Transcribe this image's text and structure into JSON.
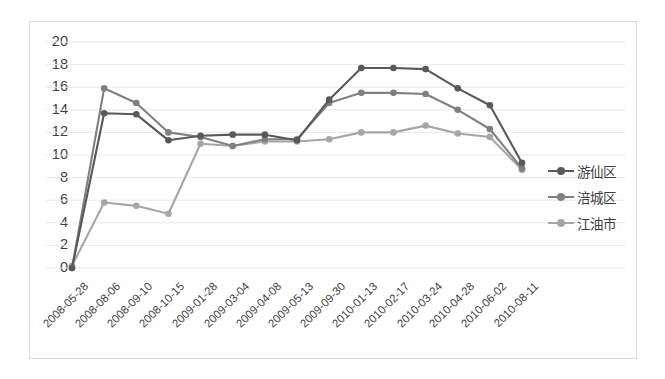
{
  "chart_data": {
    "type": "line",
    "title": "",
    "xlabel": "",
    "ylabel": "",
    "ylim": [
      0,
      20
    ],
    "yticks": [
      0,
      2,
      4,
      6,
      8,
      10,
      12,
      14,
      16,
      18,
      20
    ],
    "grid": true,
    "legend_position": "right",
    "categories": [
      "2008-05-28",
      "2008-08-06",
      "2008-09-10",
      "2008-10-15",
      "2009-01-28",
      "2009-03-04",
      "2009-04-08",
      "2009-05-13",
      "2009-09-30",
      "2010-01-13",
      "2010-02-17",
      "2010-03-24",
      "2010-04-28",
      "2010-06-02",
      "2010-08-11"
    ],
    "series": [
      {
        "name": "游仙区",
        "color": "#595959",
        "values": [
          0,
          13.7,
          13.6,
          11.3,
          11.7,
          11.8,
          11.8,
          11.3,
          14.9,
          17.7,
          17.7,
          17.6,
          15.9,
          14.4,
          9.3
        ]
      },
      {
        "name": "涪城区",
        "color": "#808080",
        "values": [
          0,
          15.9,
          14.6,
          12.0,
          11.6,
          10.8,
          11.4,
          11.4,
          14.6,
          15.5,
          15.5,
          15.4,
          14.0,
          12.3,
          8.8
        ]
      },
      {
        "name": "江油市",
        "color": "#a6a6a6",
        "values": [
          0.2,
          5.8,
          5.5,
          4.8,
          11.0,
          10.8,
          11.2,
          11.2,
          11.4,
          12.0,
          12.0,
          12.6,
          11.9,
          11.6,
          8.7
        ]
      }
    ]
  },
  "legend": {
    "items": [
      {
        "label": "游仙区",
        "color": "#595959"
      },
      {
        "label": "涪城区",
        "color": "#808080"
      },
      {
        "label": "江油市",
        "color": "#a6a6a6"
      }
    ]
  }
}
